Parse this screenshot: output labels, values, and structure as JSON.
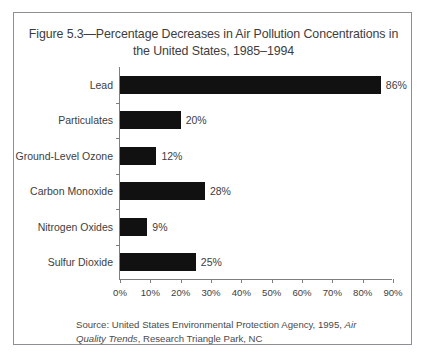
{
  "figure": {
    "title": "Figure 5.3—Percentage Decreases in Air Pollution Concentrations in the United States, 1985–1994",
    "border_color": "#8e8e94"
  },
  "source": {
    "prefix": "Source: United States Environmental Protection Agency, 1995, ",
    "italic_part": "Air Quality Trends",
    "suffix": ", Research Triangle Park, NC"
  },
  "chart_data": {
    "type": "bar",
    "orientation": "horizontal",
    "title": "Figure 5.3—Percentage Decreases in Air Pollution Concentrations in the United States, 1985–1994",
    "xlabel": "",
    "ylabel": "",
    "categories": [
      "Lead",
      "Particulates",
      "Ground-Level Ozone",
      "Carbon Monoxide",
      "Nitrogen Oxides",
      "Sulfur Dioxide"
    ],
    "values": [
      86,
      20,
      12,
      28,
      9,
      25
    ],
    "value_labels": [
      "86%",
      "20%",
      "12%",
      "28%",
      "9%",
      "25%"
    ],
    "xlim": [
      0,
      90
    ],
    "xticks": [
      0,
      10,
      20,
      30,
      40,
      50,
      60,
      70,
      80,
      90
    ],
    "xtick_labels": [
      "0%",
      "10%",
      "20%",
      "30%",
      "40%",
      "50%",
      "60%",
      "70%",
      "80%",
      "90%"
    ],
    "grid": false,
    "legend": null,
    "bar_color": "#111111",
    "axis_color": "#7d7d82"
  }
}
